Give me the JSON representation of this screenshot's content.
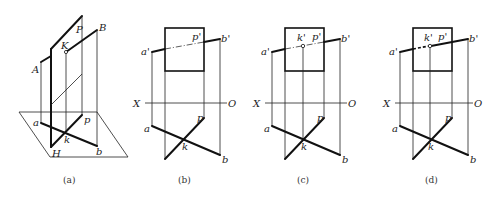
{
  "figure": {
    "panels": [
      {
        "id": "a",
        "caption": "(a)",
        "labels": {
          "P": "P",
          "B": "B",
          "K": "K",
          "A": "A",
          "a": "a",
          "p": "p",
          "k": "k",
          "b": "b",
          "H": "H"
        }
      },
      {
        "id": "b",
        "caption": "(b)",
        "labels": {
          "a_prime": "a'",
          "p_prime": "p'",
          "b_prime": "b'",
          "X": "X",
          "O": "O",
          "a": "a",
          "p": "p",
          "k": "k",
          "b": "b"
        }
      },
      {
        "id": "c",
        "caption": "(c)",
        "labels": {
          "a_prime": "a'",
          "k_prime": "k'",
          "p_prime": "p'",
          "b_prime": "b'",
          "X": "X",
          "O": "O",
          "a": "a",
          "p": "p",
          "k": "k",
          "b": "b"
        }
      },
      {
        "id": "d",
        "caption": "(d)",
        "labels": {
          "a_prime": "a'",
          "k_prime": "k'",
          "p_prime": "p'",
          "b_prime": "b'",
          "X": "X",
          "O": "O",
          "a": "a",
          "p": "p",
          "k": "k",
          "b": "b"
        }
      }
    ]
  }
}
